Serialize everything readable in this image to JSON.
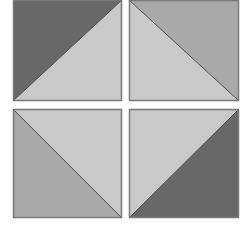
{
  "colors": {
    "dark": "#686868",
    "medium": "#a9a9a9",
    "light": "#c9c9c9",
    "edge": "#7a7a7a",
    "background": "#ffffff"
  },
  "tiles": [
    {
      "id": "top-left",
      "diagonal": "bottom-left-to-top-right",
      "upper_triangle": "dark",
      "lower_triangle": "light"
    },
    {
      "id": "top-right",
      "diagonal": "top-left-to-bottom-right",
      "upper_triangle": "medium",
      "lower_triangle": "light"
    },
    {
      "id": "bottom-left",
      "diagonal": "top-left-to-bottom-right",
      "upper_triangle": "light",
      "lower_triangle": "medium"
    },
    {
      "id": "bottom-right",
      "diagonal": "bottom-left-to-top-right",
      "upper_triangle": "light",
      "lower_triangle": "dark"
    }
  ]
}
